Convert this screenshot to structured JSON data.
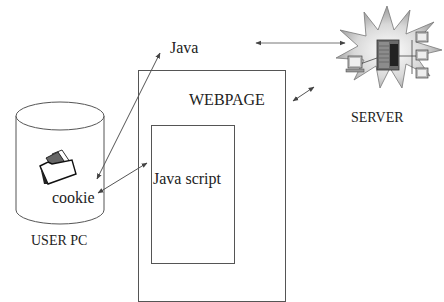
{
  "diagram": {
    "title": "",
    "nodes": {
      "java": {
        "label": "Java"
      },
      "webpage": {
        "label": "WEBPAGE"
      },
      "javascript": {
        "label": "Java script"
      },
      "cookie": {
        "label": "cookie"
      },
      "user_pc": {
        "label": "USER PC"
      },
      "server": {
        "label": "SERVER"
      }
    },
    "edges": [
      {
        "from": "cookie",
        "to": "java",
        "direction": "both"
      },
      {
        "from": "cookie",
        "to": "javascript",
        "direction": "both"
      },
      {
        "from": "java",
        "to": "server",
        "direction": "both"
      },
      {
        "from": "webpage",
        "to": "server",
        "direction": "both"
      }
    ],
    "icons": {
      "user_pc": "cylinder-database-icon",
      "cookie": "folder-icon",
      "server": "server-network-burst-icon"
    },
    "colors": {
      "line": "#555555",
      "text": "#222222",
      "background": "#ffffff"
    }
  }
}
